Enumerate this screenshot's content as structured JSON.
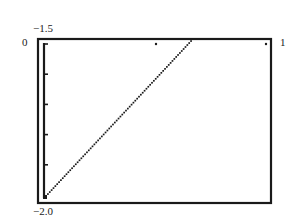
{
  "chart_data": {
    "type": "line",
    "style": "dotted",
    "title": "",
    "xlabel": "",
    "ylabel": "",
    "xlim": [
      0,
      1
    ],
    "ylim": [
      -2.0,
      -1.5
    ],
    "x_tick_labels": {
      "min": "0",
      "max": "1"
    },
    "y_tick_labels": {
      "max": "-1.5",
      "min": "-2.0"
    },
    "y_ticks_count": 5,
    "grid": false,
    "series": [
      {
        "name": "line",
        "points": [
          [
            0.0,
            -2.0
          ],
          [
            0.62,
            -1.5
          ]
        ]
      }
    ],
    "isolated_points": [
      [
        0.5,
        -1.51
      ],
      [
        0.98,
        -1.51
      ]
    ]
  },
  "labels": {
    "y_top": "−1.5",
    "y_bottom": "−2.0",
    "x_left": "0",
    "x_right": "1"
  },
  "colors": {
    "frame": "#1a1a1a",
    "line": "#1a1a1a",
    "background": "#ffffff"
  }
}
